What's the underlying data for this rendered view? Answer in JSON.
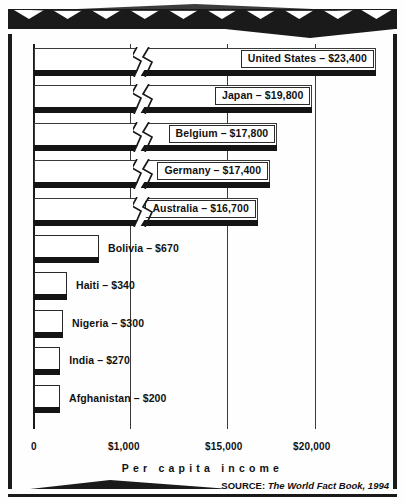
{
  "chart_data": {
    "type": "bar",
    "orientation": "horizontal",
    "title": "",
    "xlabel": "Per capita income",
    "ylabel": "",
    "categories": [
      "United States",
      "Japan",
      "Belgium",
      "Germany",
      "Australia",
      "Bolivia",
      "Haiti",
      "Nigeria",
      "India",
      "Afghanistan"
    ],
    "values": [
      23400,
      19800,
      17800,
      17400,
      16700,
      670,
      340,
      300,
      270,
      200
    ],
    "value_labels": [
      "$23,400",
      "$19,800",
      "$17,800",
      "$17,400",
      "$16,700",
      "$670",
      "$340",
      "$300",
      "$270",
      "$200"
    ],
    "bar_labels": [
      "United States – $23,400",
      "Japan – $19,800",
      "Belgium – $17,800",
      "Germany – $17,400",
      "Australia – $16,700",
      "Bolivia – $670",
      "Haiti – $340",
      "Nigeria – $300",
      "India – $270",
      "Afghanistan – $200"
    ],
    "axis_ticks": [
      "0",
      "$1,000",
      "$15,000",
      "$20,000"
    ],
    "axis_tick_values": [
      0,
      1000,
      15000,
      20000
    ],
    "broken_axis": true,
    "axis_break_between": [
      1000,
      15000
    ],
    "grid": true,
    "legend": null,
    "source": {
      "prefix": "SOURCE:",
      "text": "The World Fact Book, 1994"
    },
    "colors": {
      "bar_fill": "#ffffff",
      "bar_edge": "#2a2a2a",
      "bar_foot": "#141414",
      "ink": "#1a1a1a",
      "grid": "#3a3a3a"
    }
  },
  "decor": {
    "band_notch_count": 10
  }
}
